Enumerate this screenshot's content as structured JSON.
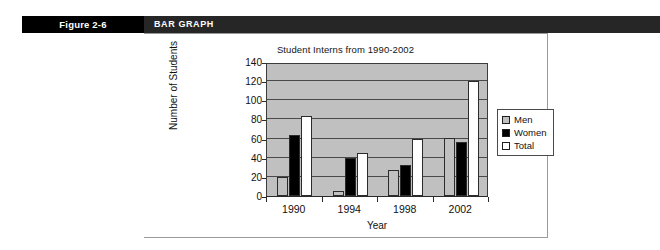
{
  "figure": {
    "number_label": "Figure 2-6",
    "header_title": "BAR GRAPH"
  },
  "colors": {
    "header_band": "#1a1a1a",
    "figure_cell": "#000000",
    "plot_background": "#c0c0c0",
    "men": "#c0c0c0",
    "women": "#000000",
    "total": "#ffffff",
    "axis": "#2a2a2a"
  },
  "chart_data": {
    "type": "bar",
    "title": "Student Interns from 1990-2002",
    "xlabel": "Year",
    "ylabel": "Number of Students",
    "categories": [
      "1990",
      "1994",
      "1998",
      "2002"
    ],
    "series": [
      {
        "name": "Men",
        "values": [
          20,
          5,
          27,
          61
        ]
      },
      {
        "name": "Women",
        "values": [
          64,
          40,
          32,
          56
        ]
      },
      {
        "name": "Total",
        "values": [
          84,
          45,
          60,
          120
        ]
      }
    ],
    "ylim": [
      0,
      140
    ],
    "ytick_values": [
      0,
      20,
      40,
      60,
      80,
      100,
      120,
      140
    ],
    "ytick_labels": [
      "0",
      "20",
      "40",
      "60",
      "80",
      "100",
      "120",
      "140"
    ],
    "grid": true,
    "legend_position": "right"
  }
}
